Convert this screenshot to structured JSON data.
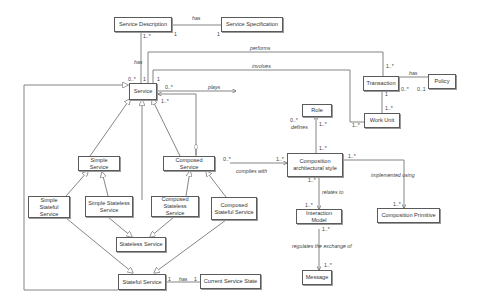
{
  "diagram": {
    "type": "UML class diagram",
    "classes": {
      "service_description": "Service Description",
      "service_specification": "Service Specification",
      "service": "Service",
      "role": "Role",
      "transaction": "Transaction",
      "policy": "Policy",
      "work_unit": "Work Unit",
      "simple_service": "Simple Service",
      "composed_service": "Composed Service",
      "simple_stateful_service": "Simple Stateful Service",
      "simple_stateless_service": "Simple Stateless Service",
      "composed_stateless_service": "Composed Stateless Service",
      "composed_stateful_service": "Composed Stateful Service",
      "stateless_service": "Stateless Service",
      "stateful_service": "Stateful Service",
      "current_service_state": "Current Service State",
      "composition_architectural_style": "Composition architectural style",
      "interaction_model": "Interaction Model",
      "composition_primitive": "Composition Primitive",
      "message": "Message"
    },
    "associations": {
      "desc_spec": {
        "label": "has",
        "m1": "1",
        "m2": "1"
      },
      "desc_service": {
        "label": "has",
        "m1": "1..*",
        "m2": "0..*"
      },
      "performs": {
        "label": "performs",
        "m1": "1",
        "m2": "1..*"
      },
      "involves": {
        "label": "involves",
        "m1": "1",
        "m2": "1..*"
      },
      "plays": {
        "label": "plays",
        "m1": "0..*",
        "m2": ""
      },
      "defines": {
        "label": "defines",
        "m1": "0..*",
        "m2": "1..*"
      },
      "role_cas": {
        "m": "1..*"
      },
      "trans_policy": {
        "label": "has",
        "m1": "0..*",
        "m2": "0..1"
      },
      "trans_work": {
        "m1": "1",
        "m2": "1..*"
      },
      "composed_service_agg": {
        "m": "1..*"
      },
      "complies_with": {
        "label": "complies with",
        "m1": "0..*",
        "m2": "1..*"
      },
      "relates_to": {
        "label": "relates to",
        "m1": "1..*",
        "m2": "1..*"
      },
      "implemented_using": {
        "label": "implemented using",
        "m1": "1..*",
        "m2": "1..*"
      },
      "regulates": {
        "label": "regulates the exchange of",
        "m1": "1..*",
        "m2": "1..*"
      },
      "stateful_state": {
        "label": "has",
        "m1": "1",
        "m2": "1"
      }
    }
  }
}
